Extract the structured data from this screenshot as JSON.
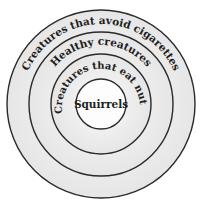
{
  "diagram": {
    "type": "nested-circles (Euler diagram)",
    "colors": {
      "stroke": "#2a2a2a",
      "fill": "#ececec",
      "fill_light": "#f7f7f7",
      "text": "#1e1e1e"
    },
    "circles": [
      {
        "label": "Creatures that avoid cigarettes",
        "radius": 94
      },
      {
        "label": "Healthy creatures",
        "radius": 72
      },
      {
        "label": "Creatures that eat nuts",
        "radius": 50
      },
      {
        "label": "Squirrels",
        "radius": 25
      }
    ]
  }
}
